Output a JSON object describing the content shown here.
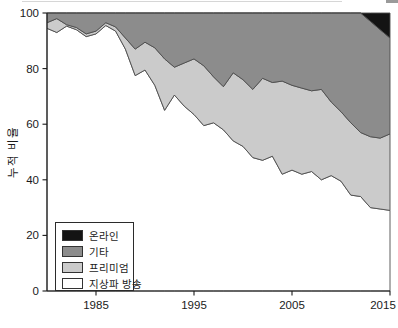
{
  "y_axis": {
    "title": "누적 비율",
    "ticks": [
      0,
      20,
      40,
      60,
      80,
      100
    ],
    "range": [
      0,
      100
    ]
  },
  "x_axis": {
    "ticks": [
      1985,
      1995,
      2005,
      2015
    ],
    "range": [
      1980,
      2015
    ]
  },
  "chart_data": {
    "type": "area",
    "stacked": true,
    "title": "",
    "xlabel": "",
    "ylabel": "누적 비율",
    "xlim": [
      1980,
      2015
    ],
    "ylim": [
      0,
      100
    ],
    "grid": false,
    "legend_position": "lower-left",
    "legend_order": [
      "온라인",
      "기타",
      "프리미엄",
      "지상파 방송"
    ],
    "x": [
      1980,
      1981,
      1982,
      1983,
      1984,
      1985,
      1986,
      1987,
      1988,
      1989,
      1990,
      1991,
      1992,
      1993,
      1994,
      1995,
      1996,
      1997,
      1998,
      1999,
      2000,
      2001,
      2002,
      2003,
      2004,
      2005,
      2006,
      2007,
      2008,
      2009,
      2010,
      2011,
      2012,
      2013,
      2014,
      2015
    ],
    "series": [
      {
        "name": "지상파 방송",
        "color": "#ffffff",
        "values": [
          94.5,
          93,
          95.3,
          94,
          91.5,
          92.5,
          95.5,
          93.5,
          87,
          77.5,
          79.5,
          74,
          65,
          70.5,
          66.5,
          63.5,
          59.5,
          60.5,
          58,
          54,
          52,
          48,
          47,
          48.5,
          42,
          43.5,
          42,
          43,
          40,
          41.5,
          39.5,
          34.5,
          34,
          30,
          29.5,
          29
        ]
      },
      {
        "name": "프리미엄",
        "color": "#cbcbcb",
        "values": [
          2,
          5,
          0.5,
          0.8,
          1,
          1,
          1,
          1.5,
          4,
          9.5,
          10,
          13.5,
          18.5,
          10,
          15.5,
          20,
          21.5,
          16.5,
          15.5,
          24.5,
          24,
          24.5,
          29.5,
          26.5,
          33.5,
          30.5,
          31,
          29,
          32.5,
          26.5,
          25,
          26,
          23,
          25.5,
          25.5,
          27.5
        ]
      },
      {
        "name": "기타",
        "color": "#8c8c8c",
        "values": [
          3.5,
          2,
          4.2,
          5.2,
          7.5,
          6.5,
          3.5,
          5,
          9,
          13,
          10.5,
          12.5,
          16.5,
          19.5,
          18,
          16.5,
          19,
          23,
          26.5,
          21.5,
          24,
          27.5,
          23.5,
          25,
          24.5,
          26,
          27,
          28,
          27.5,
          32,
          35.5,
          39.5,
          43,
          41.5,
          39,
          34.5
        ]
      },
      {
        "name": "온라인",
        "color": "#141414",
        "values": [
          0,
          0,
          0,
          0,
          0,
          0,
          0,
          0,
          0,
          0,
          0,
          0,
          0,
          0,
          0,
          0,
          0,
          0,
          0,
          0,
          0,
          0,
          0,
          0,
          0,
          0,
          0,
          0,
          0,
          0,
          0,
          0,
          0,
          3,
          6,
          9
        ]
      }
    ]
  },
  "style": {
    "area_edge_color": "#4d4d4d",
    "axis_color": "#1a1a1a",
    "tick_label_color": "#1a1a1a"
  }
}
